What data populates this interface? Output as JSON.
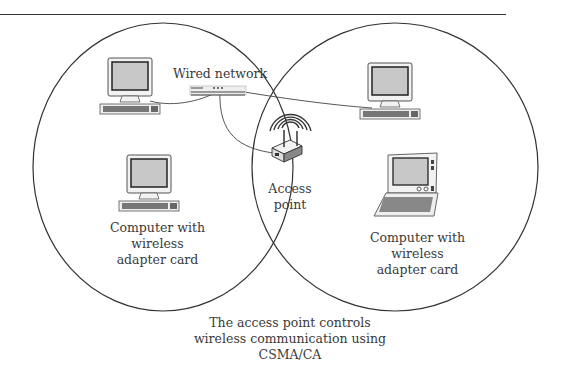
{
  "diagram": {
    "type": "wireless-network-overlap",
    "labels": {
      "wired_network": "Wired network",
      "access_point": [
        "Access",
        "point"
      ],
      "left_computer": [
        "Computer with",
        "wireless",
        "adapter card"
      ],
      "right_computer": [
        "Computer with",
        "wireless",
        "adapter card"
      ],
      "caption": [
        "The access point controls",
        "wireless communication using",
        "CSMA/CA"
      ]
    },
    "nodes": [
      {
        "id": "desktop-top-left",
        "kind": "desktop-computer"
      },
      {
        "id": "network-hub",
        "kind": "hub"
      },
      {
        "id": "desktop-top-right",
        "kind": "desktop-computer"
      },
      {
        "id": "access-point",
        "kind": "wireless-access-point"
      },
      {
        "id": "desktop-wireless-left",
        "kind": "desktop-computer"
      },
      {
        "id": "laptop-wireless-right",
        "kind": "laptop-computer"
      }
    ],
    "connections": [
      {
        "from": "desktop-top-left",
        "to": "network-hub"
      },
      {
        "from": "network-hub",
        "to": "desktop-top-right"
      },
      {
        "from": "network-hub",
        "to": "access-point"
      }
    ],
    "coverage_areas": 2,
    "colors": {
      "line": "#333333",
      "screen": "#c8c8c8",
      "case": "#f2f2f2"
    }
  }
}
